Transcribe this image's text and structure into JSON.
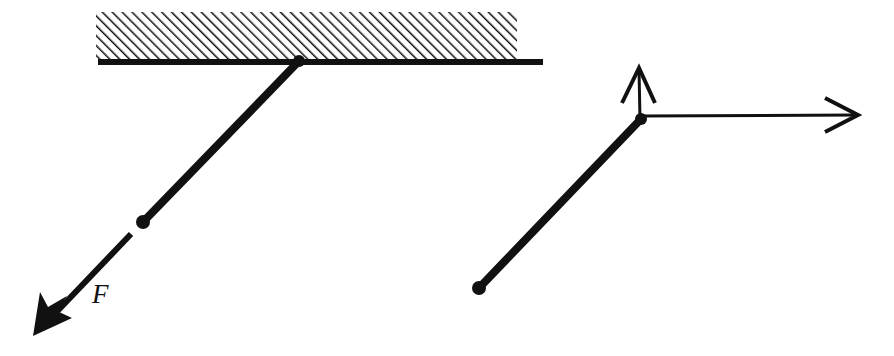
{
  "figure": {
    "background_color": "#ffffff",
    "ink_color": "#111111",
    "panels": [
      {
        "id": "left-panel",
        "name": "rod-on-ceiling-with-force",
        "description": "Hatched ceiling with a rigid rod hinged at a pivot, a bob mass, and an applied force arrow labeled F"
      },
      {
        "id": "right-panel",
        "name": "rod-vector-decomposition",
        "description": "Same rod drawn free, with a vertical arrow and a horizontal arrow emanating from the top vertex"
      }
    ]
  },
  "left_panel": {
    "ceiling": {
      "label": "hatched-ceiling",
      "hatch_angle_deg": 45,
      "hatch_spacing_px": 7,
      "block": {
        "x": 96,
        "y": 12,
        "width": 421,
        "height": 48
      },
      "baseline": {
        "x1": 98,
        "y1": 62,
        "x2": 543,
        "y2": 62,
        "thickness": 6
      }
    },
    "pivot": {
      "label": "pivot-point",
      "cx": 299,
      "cy": 61,
      "r": 6
    },
    "rod": {
      "label": "rigid-rod",
      "x1": 299,
      "y1": 61,
      "x2": 143,
      "y2": 222,
      "thickness": 8
    },
    "bob": {
      "label": "bob-mass-point",
      "cx": 143,
      "cy": 222,
      "r": 7
    },
    "force_arrow": {
      "label": "applied-force-arrow",
      "x1": 131,
      "y1": 234,
      "x2": 33,
      "y2": 336,
      "thickness": 6,
      "head_style": "filled-barbed"
    },
    "force_label": {
      "text": "F",
      "x": 92,
      "y": 303
    }
  },
  "right_panel": {
    "vertex": {
      "label": "vertex-point",
      "cx": 641,
      "cy": 119,
      "r": 6
    },
    "rod": {
      "label": "rigid-rod",
      "x1": 641,
      "y1": 119,
      "x2": 479,
      "y2": 288,
      "thickness": 8
    },
    "end_point": {
      "label": "rod-end-mass-point",
      "cx": 479,
      "cy": 288,
      "r": 7
    },
    "vertical_arrow": {
      "label": "vertical-component-arrow",
      "x1": 640,
      "y1": 119,
      "x2": 639,
      "y2": 70,
      "thickness": 3,
      "head_style": "open-v"
    },
    "horizontal_arrow": {
      "label": "horizontal-component-arrow",
      "x1": 641,
      "y1": 116,
      "x2": 857,
      "y2": 115,
      "thickness": 3,
      "head_style": "open-v"
    }
  }
}
